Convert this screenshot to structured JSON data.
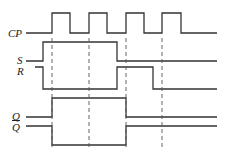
{
  "diagram": {
    "type": "timing-diagram",
    "signals": [
      {
        "name": "CP",
        "label": "CP"
      },
      {
        "name": "S",
        "label": "S"
      },
      {
        "name": "R",
        "label": "R"
      },
      {
        "name": "Q",
        "label": "Q"
      },
      {
        "name": "Qbar",
        "label": "Q"
      }
    ],
    "clock_pulses": 4,
    "line_color": "#333333"
  }
}
